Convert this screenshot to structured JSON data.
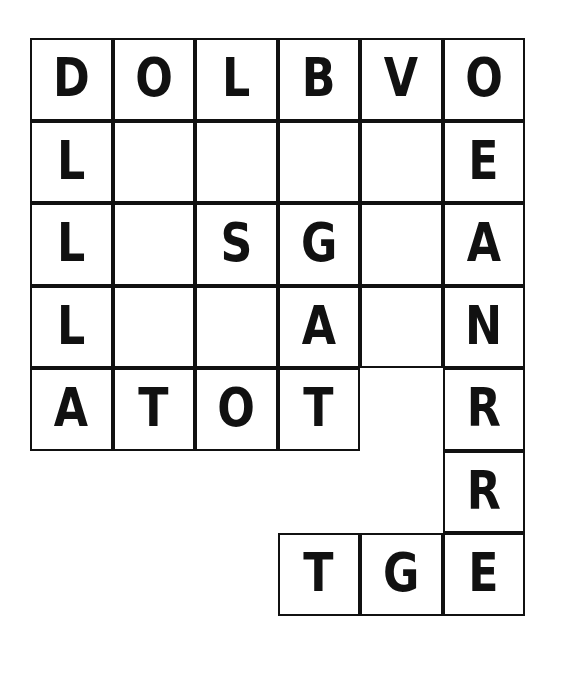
{
  "puzzle": {
    "type": "word-grid",
    "columns": 6,
    "rows": 7,
    "grid_origin": {
      "x": 30,
      "y": 38
    },
    "cell_size": 82.5,
    "colors": {
      "border": "#111111",
      "cell_background": "#ffffff",
      "letter": "#111111",
      "page_background": "#ffffff"
    },
    "rows_data": [
      {
        "index": 1,
        "cells": [
          {
            "col": 0,
            "letter": "D",
            "state": "filled"
          },
          {
            "col": 1,
            "letter": "O",
            "state": "filled"
          },
          {
            "col": 2,
            "letter": "L",
            "state": "filled"
          },
          {
            "col": 3,
            "letter": "B",
            "state": "filled"
          },
          {
            "col": 4,
            "letter": "V",
            "state": "filled"
          },
          {
            "col": 5,
            "letter": "O",
            "state": "filled"
          }
        ]
      },
      {
        "index": 2,
        "cells": [
          {
            "col": 0,
            "letter": "L",
            "state": "filled"
          },
          {
            "col": 1,
            "letter": "",
            "state": "blank"
          },
          {
            "col": 2,
            "letter": "",
            "state": "blank"
          },
          {
            "col": 3,
            "letter": "",
            "state": "blank"
          },
          {
            "col": 4,
            "letter": "",
            "state": "blank"
          },
          {
            "col": 5,
            "letter": "E",
            "state": "filled"
          }
        ]
      },
      {
        "index": 3,
        "cells": [
          {
            "col": 0,
            "letter": "L",
            "state": "filled"
          },
          {
            "col": 1,
            "letter": "",
            "state": "blank"
          },
          {
            "col": 2,
            "letter": "S",
            "state": "filled"
          },
          {
            "col": 3,
            "letter": "G",
            "state": "filled"
          },
          {
            "col": 4,
            "letter": "",
            "state": "blank"
          },
          {
            "col": 5,
            "letter": "A",
            "state": "filled"
          }
        ]
      },
      {
        "index": 4,
        "cells": [
          {
            "col": 0,
            "letter": "L",
            "state": "filled"
          },
          {
            "col": 1,
            "letter": "",
            "state": "blank"
          },
          {
            "col": 2,
            "letter": "",
            "state": "blank"
          },
          {
            "col": 3,
            "letter": "A",
            "state": "filled"
          },
          {
            "col": 4,
            "letter": "",
            "state": "blank"
          },
          {
            "col": 5,
            "letter": "N",
            "state": "filled"
          }
        ]
      },
      {
        "index": 5,
        "cells": [
          {
            "col": 0,
            "letter": "A",
            "state": "filled"
          },
          {
            "col": 1,
            "letter": "T",
            "state": "filled"
          },
          {
            "col": 2,
            "letter": "O",
            "state": "filled"
          },
          {
            "col": 3,
            "letter": "T",
            "state": "filled"
          },
          {
            "col": 4,
            "letter": "",
            "state": "empty"
          },
          {
            "col": 5,
            "letter": "R",
            "state": "filled"
          }
        ]
      },
      {
        "index": 6,
        "cells": [
          {
            "col": 0,
            "letter": "",
            "state": "empty"
          },
          {
            "col": 1,
            "letter": "",
            "state": "empty"
          },
          {
            "col": 2,
            "letter": "",
            "state": "empty"
          },
          {
            "col": 3,
            "letter": "",
            "state": "empty"
          },
          {
            "col": 4,
            "letter": "",
            "state": "empty"
          },
          {
            "col": 5,
            "letter": "R",
            "state": "filled"
          }
        ]
      },
      {
        "index": 7,
        "cells": [
          {
            "col": 0,
            "letter": "",
            "state": "empty"
          },
          {
            "col": 1,
            "letter": "",
            "state": "empty"
          },
          {
            "col": 2,
            "letter": "",
            "state": "empty"
          },
          {
            "col": 3,
            "letter": "T",
            "state": "filled"
          },
          {
            "col": 4,
            "letter": "G",
            "state": "filled"
          },
          {
            "col": 5,
            "letter": "E",
            "state": "filled"
          }
        ]
      }
    ],
    "words": {
      "across_row1": "DOLBVO",
      "across_row5": "ATOT",
      "across_row3_middle": "SG",
      "across_row7": "TGE",
      "down_col0": "DOLLA",
      "down_col5": "OEANRRE",
      "down_col3": "BGAT"
    }
  }
}
